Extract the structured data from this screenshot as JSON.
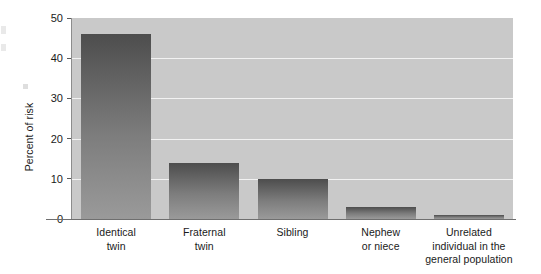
{
  "chart_data": {
    "type": "bar",
    "title": "",
    "xlabel": "",
    "ylabel": "Percent of risk",
    "ylim": [
      0,
      50
    ],
    "ytick_labels": [
      "0",
      "10",
      "20",
      "30",
      "40",
      "50"
    ],
    "ytick_values": [
      0,
      10,
      20,
      30,
      40,
      50
    ],
    "gridlines": [
      10,
      20,
      30,
      40
    ],
    "grid": true,
    "legend": null,
    "categories": [
      "Identical twin",
      "Fraternal twin",
      "Sibling",
      "Nephew or niece",
      "Unrelated individual in the general population"
    ],
    "category_label_lines": [
      [
        "Identical",
        "twin"
      ],
      [
        "Fraternal",
        "twin"
      ],
      [
        "Sibling"
      ],
      [
        "Nephew",
        "or niece"
      ],
      [
        "Unrelated",
        "individual in the",
        "general population"
      ]
    ],
    "values": [
      46,
      14,
      10,
      3,
      1
    ],
    "colors": {
      "plot_background": "#c9c9c9",
      "gridline": "#f2f2f2",
      "bar_top": "#4d4d4d",
      "bar_bottom": "#9a9a9a",
      "axis": "#6f6f6f",
      "text": "#1a1a1a",
      "page_background": "#ffffff"
    }
  }
}
